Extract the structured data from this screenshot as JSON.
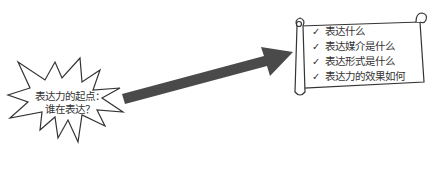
{
  "star": {
    "line1": "表达力的起点：",
    "line2": "谁在表达？"
  },
  "arrow": {
    "color": "#4a4a4a"
  },
  "scroll": {
    "items": [
      {
        "check": "✓",
        "label": "表达什么"
      },
      {
        "check": "✓",
        "label": "表达媒介是什么"
      },
      {
        "check": "✓",
        "label": "表达形式是什么"
      },
      {
        "check": "✓",
        "label": "表达力的效果如何"
      }
    ]
  }
}
